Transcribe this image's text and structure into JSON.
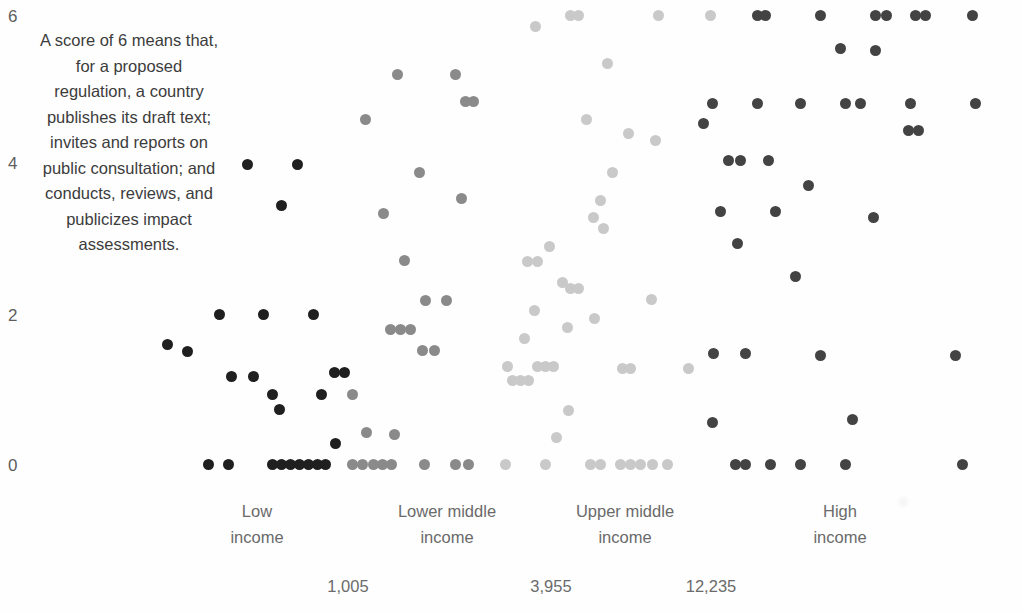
{
  "annotation": {
    "text": "A score of 6 means that, for a proposed regulation, a country publishes its draft text; invites and reports on public consultation; and conducts, reviews, and publicizes impact assessments."
  },
  "chart_data": {
    "type": "scatter",
    "title": "",
    "subtitle": "",
    "xlabel": "",
    "ylabel": "",
    "grid": false,
    "legend_position": "none",
    "ylim": [
      0,
      6
    ],
    "yticks": [
      "0",
      "2",
      "4",
      "6"
    ],
    "ytick_values": [
      0,
      2,
      4,
      6
    ],
    "x_categories": [
      {
        "label_line1": "Low",
        "label_line2": "income",
        "color": "#1f1f1f"
      },
      {
        "label_line1": "Lower middle",
        "label_line2": "income",
        "color": "#8a8a8a"
      },
      {
        "label_line1": "Upper middle",
        "label_line2": "income",
        "color": "#c9c9c9"
      },
      {
        "label_line1": "High",
        "label_line2": "income",
        "color": "#434343"
      }
    ],
    "x_secondary_axis_label": "",
    "x_secondary_ticks": [
      "1,005",
      "3,955",
      "12,235"
    ],
    "x_secondary_tick_values": [
      1005,
      3955,
      12235
    ],
    "annotation_note": "A score of 6 means that, for a proposed regulation, a country publishes its draft text; invites and reports on public consultation; and conducts, reviews, and publicizes impact assessments.",
    "series": [
      {
        "name": "Low income",
        "color": "#1f1f1f",
        "points": [
          [
            247,
            4
          ],
          [
            297,
            4
          ],
          [
            281,
            3.45
          ],
          [
            219,
            2
          ],
          [
            263,
            2
          ],
          [
            313,
            2
          ],
          [
            167,
            1.6
          ],
          [
            187,
            1.5
          ],
          [
            334,
            1.22
          ],
          [
            344,
            1.22
          ],
          [
            231,
            1.17
          ],
          [
            253,
            1.17
          ],
          [
            272,
            0.93
          ],
          [
            279,
            0.73
          ],
          [
            321,
            0.93
          ],
          [
            335,
            0.28
          ],
          [
            208,
            0
          ],
          [
            228,
            0
          ],
          [
            272,
            0
          ],
          [
            281,
            0
          ],
          [
            290,
            0
          ],
          [
            299,
            0
          ],
          [
            308,
            0
          ],
          [
            317,
            0
          ],
          [
            325,
            0
          ]
        ]
      },
      {
        "name": "Lower middle income",
        "color": "#8a8a8a",
        "points": [
          [
            397,
            5.2
          ],
          [
            365,
            4.6
          ],
          [
            455,
            5.2
          ],
          [
            465,
            4.85
          ],
          [
            473,
            4.85
          ],
          [
            419,
            3.9
          ],
          [
            383,
            3.35
          ],
          [
            461,
            3.55
          ],
          [
            404,
            2.72
          ],
          [
            446,
            2.18
          ],
          [
            425,
            2.18
          ],
          [
            390,
            1.8
          ],
          [
            400,
            1.8
          ],
          [
            410,
            1.8
          ],
          [
            422,
            1.52
          ],
          [
            434,
            1.52
          ],
          [
            352,
            0.93
          ],
          [
            366,
            0.42
          ],
          [
            394,
            0.4
          ],
          [
            352,
            0
          ],
          [
            362,
            0
          ],
          [
            373,
            0
          ],
          [
            382,
            0
          ],
          [
            391,
            0
          ],
          [
            424,
            0
          ],
          [
            455,
            0
          ],
          [
            468,
            0
          ]
        ]
      },
      {
        "name": "Upper middle income",
        "color": "#c9c9c9",
        "points": [
          [
            570,
            6
          ],
          [
            578,
            6
          ],
          [
            658,
            6
          ],
          [
            710,
            6
          ],
          [
            535,
            5.85
          ],
          [
            607,
            5.35
          ],
          [
            586,
            4.6
          ],
          [
            628,
            4.42
          ],
          [
            655,
            4.32
          ],
          [
            612,
            3.9
          ],
          [
            600,
            3.52
          ],
          [
            593,
            3.3
          ],
          [
            603,
            3.15
          ],
          [
            549,
            2.9
          ],
          [
            527,
            2.7
          ],
          [
            537,
            2.7
          ],
          [
            562,
            2.42
          ],
          [
            570,
            2.35
          ],
          [
            578,
            2.35
          ],
          [
            651,
            2.2
          ],
          [
            534,
            2.05
          ],
          [
            594,
            1.95
          ],
          [
            567,
            1.82
          ],
          [
            524,
            1.68
          ],
          [
            507,
            1.3
          ],
          [
            537,
            1.3
          ],
          [
            545,
            1.3
          ],
          [
            553,
            1.3
          ],
          [
            622,
            1.28
          ],
          [
            630,
            1.28
          ],
          [
            688,
            1.28
          ],
          [
            512,
            1.12
          ],
          [
            520,
            1.12
          ],
          [
            528,
            1.12
          ],
          [
            568,
            0.72
          ],
          [
            556,
            0.35
          ],
          [
            505,
            0
          ],
          [
            545,
            0
          ],
          [
            590,
            0
          ],
          [
            600,
            0
          ],
          [
            620,
            0
          ],
          [
            630,
            0
          ],
          [
            640,
            0
          ],
          [
            652,
            0
          ],
          [
            667,
            0
          ]
        ]
      },
      {
        "name": "High income",
        "color": "#434343",
        "points": [
          [
            757,
            6
          ],
          [
            765,
            6
          ],
          [
            820,
            6
          ],
          [
            875,
            6
          ],
          [
            886,
            6
          ],
          [
            915,
            6
          ],
          [
            925,
            6
          ],
          [
            972,
            6
          ],
          [
            840,
            5.55
          ],
          [
            875,
            5.52
          ],
          [
            712,
            4.82
          ],
          [
            757,
            4.82
          ],
          [
            800,
            4.82
          ],
          [
            845,
            4.82
          ],
          [
            860,
            4.82
          ],
          [
            910,
            4.82
          ],
          [
            703,
            4.55
          ],
          [
            908,
            4.45
          ],
          [
            918,
            4.45
          ],
          [
            975,
            4.82
          ],
          [
            728,
            4.05
          ],
          [
            740,
            4.05
          ],
          [
            768,
            4.05
          ],
          [
            808,
            3.72
          ],
          [
            720,
            3.38
          ],
          [
            775,
            3.38
          ],
          [
            873,
            3.3
          ],
          [
            737,
            2.95
          ],
          [
            795,
            2.5
          ],
          [
            713,
            1.48
          ],
          [
            745,
            1.48
          ],
          [
            820,
            1.45
          ],
          [
            955,
            1.45
          ],
          [
            852,
            0.6
          ],
          [
            712,
            0.55
          ],
          [
            735,
            0
          ],
          [
            745,
            0
          ],
          [
            770,
            0
          ],
          [
            800,
            0
          ],
          [
            845,
            0
          ],
          [
            962,
            0
          ]
        ]
      }
    ]
  }
}
